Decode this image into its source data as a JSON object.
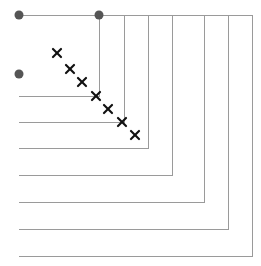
{
  "figure": {
    "title": "",
    "width": 261,
    "height": 266,
    "background": "#ffffff",
    "step_line_color": "#9a9a9a",
    "step_line_width": 1,
    "circle_marker_color": "#555555",
    "circle_marker_radius": 4.5,
    "cross_marker_color": "#101010",
    "cross_marker_size": 8,
    "cross_marker_stroke": 2.2
  },
  "chart_data": {
    "type": "line",
    "title": "",
    "subtitle": "",
    "xlabel": "",
    "ylabel": "",
    "xlim": [
      0,
      261
    ],
    "ylim": [
      266,
      0
    ],
    "grid": false,
    "legend": false,
    "legend_position": "none",
    "series": [
      {
        "name": "staircase-1",
        "type": "step",
        "color": "#9a9a9a",
        "points": [
          [
            19,
            15
          ],
          [
            99,
            15
          ],
          [
            99,
            96
          ],
          [
            19,
            96
          ]
        ],
        "corner": [
          99,
          96
        ]
      },
      {
        "name": "staircase-2",
        "type": "step",
        "color": "#9a9a9a",
        "points": [
          [
            19,
            15
          ],
          [
            124,
            15
          ],
          [
            124,
            122
          ],
          [
            19,
            122
          ]
        ],
        "corner": [
          124,
          122
        ]
      },
      {
        "name": "staircase-3",
        "type": "step",
        "color": "#9a9a9a",
        "points": [
          [
            19,
            15
          ],
          [
            148,
            15
          ],
          [
            148,
            148
          ],
          [
            19,
            148
          ]
        ],
        "corner": [
          148,
          148
        ]
      },
      {
        "name": "staircase-4",
        "type": "step",
        "color": "#9a9a9a",
        "points": [
          [
            19,
            15
          ],
          [
            172,
            15
          ],
          [
            172,
            175
          ],
          [
            19,
            175
          ]
        ],
        "corner": [
          172,
          175
        ]
      },
      {
        "name": "staircase-5",
        "type": "step",
        "color": "#9a9a9a",
        "points": [
          [
            19,
            15
          ],
          [
            204,
            15
          ],
          [
            204,
            202
          ],
          [
            19,
            202
          ]
        ],
        "corner": [
          204,
          202
        ]
      },
      {
        "name": "staircase-6",
        "type": "step",
        "color": "#9a9a9a",
        "points": [
          [
            19,
            15
          ],
          [
            228,
            15
          ],
          [
            228,
            229
          ],
          [
            19,
            229
          ]
        ],
        "corner": [
          228,
          229
        ]
      },
      {
        "name": "staircase-7",
        "type": "step",
        "color": "#9a9a9a",
        "points": [
          [
            19,
            15
          ],
          [
            252,
            15
          ],
          [
            252,
            256
          ],
          [
            19,
            256
          ]
        ],
        "corner": [
          252,
          256
        ]
      }
    ],
    "circle_points": [
      {
        "label": "circle-top-left",
        "x": 19,
        "y": 15
      },
      {
        "label": "circle-top-mid",
        "x": 99,
        "y": 15
      },
      {
        "label": "circle-left-mid",
        "x": 19,
        "y": 74
      }
    ],
    "cross_points": [
      {
        "label": "cross-1",
        "x": 57,
        "y": 53
      },
      {
        "label": "cross-2",
        "x": 70,
        "y": 69
      },
      {
        "label": "cross-3",
        "x": 82,
        "y": 82
      },
      {
        "label": "cross-4",
        "x": 96,
        "y": 96
      },
      {
        "label": "cross-5",
        "x": 108,
        "y": 109
      },
      {
        "label": "cross-6",
        "x": 122,
        "y": 122
      },
      {
        "label": "cross-7",
        "x": 135,
        "y": 135
      }
    ]
  }
}
